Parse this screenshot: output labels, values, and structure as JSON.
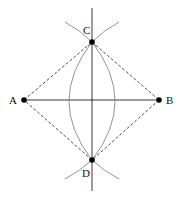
{
  "diagram": {
    "points": [
      {
        "id": "A",
        "label": "A",
        "x": 24,
        "y": 100,
        "lx": 9,
        "ly": 104
      },
      {
        "id": "B",
        "label": "B",
        "x": 159,
        "y": 100,
        "lx": 166,
        "ly": 104
      },
      {
        "id": "C",
        "label": "C",
        "x": 92,
        "y": 42,
        "lx": 82,
        "ly": 34
      },
      {
        "id": "D",
        "label": "D",
        "x": 92,
        "y": 160,
        "lx": 82,
        "ly": 177
      }
    ],
    "colors": {
      "line": "#222222",
      "arc": "#777777",
      "point": "#000000"
    }
  }
}
